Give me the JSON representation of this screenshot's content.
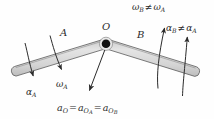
{
  "figure": {
    "background_color": "#fefefe",
    "bar_fill_color": "#d9d9d9",
    "bar_stroke_color": "#4a4a4a",
    "arrow_color": "#2b2b2b",
    "pin_color": "#111111",
    "labels": {
      "bar_a": "A",
      "bar_b": "B",
      "pin_point": "O",
      "alpha_a": "α",
      "alpha_a_sub": "A",
      "omega_a": "ω",
      "omega_a_sub": "A",
      "omega_b": "ω",
      "omega_b_sub": "B",
      "omega_neq_op": "≠",
      "omega_b_rhs": "ω",
      "omega_b_rhs_sub": "A",
      "alpha_b": "α",
      "alpha_b_sub": "B",
      "alpha_neq_op": "≠",
      "alpha_b_rhs": "α",
      "alpha_b_rhs_sub": "A",
      "accel_a": "a",
      "accel_a_sub": "O",
      "accel_eq1": "=",
      "accel_b": "a",
      "accel_b_sub": "O",
      "accel_b_sub2": "A",
      "accel_eq2": "=",
      "accel_c": "a",
      "accel_c_sub": "O",
      "accel_c_sub2": "B"
    },
    "annotations": {
      "omega_relation": "ωB ≠ ωA",
      "alpha_relation": "αB ≠ αA",
      "accel_relation": "aO = aOA = aOB"
    }
  }
}
